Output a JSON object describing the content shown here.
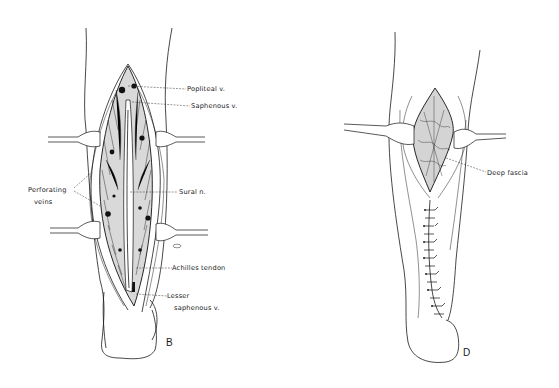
{
  "figure": {
    "panels": [
      {
        "id": "B",
        "letter": "B",
        "description": "Posterior calf with open longitudinal incision retracted, exposing veins, nerve and tendon",
        "labels": {
          "popliteal": "Popliteal v.",
          "saphenous": "Saphenous v.",
          "perforating_1": "Perforating",
          "perforating_2": "veins",
          "sural": "Sural n.",
          "achilles": "Achilles tendon",
          "lesser_1": "Lesser",
          "lesser_2": "saphenous v."
        }
      },
      {
        "id": "D",
        "letter": "D",
        "description": "Posterior calf with upper incision retracted exposing deep fascia and lower incision closed with sutures",
        "labels": {
          "deep_fascia": "Deep fascia"
        }
      }
    ]
  }
}
